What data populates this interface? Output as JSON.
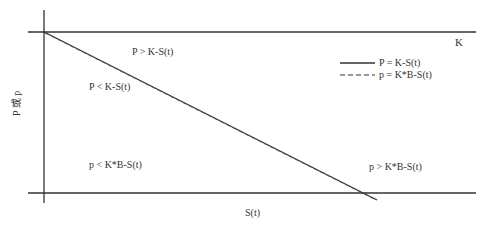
{
  "diagram": {
    "type": "option price bound diagram",
    "axes": {
      "y_label": "P 或 p",
      "x_label": "S(t)"
    },
    "horizontal_line_label": "K",
    "regions": [
      {
        "id": "upper-right",
        "text": "P > K-S(t)"
      },
      {
        "id": "upper-left",
        "text": "P < K-S(t)"
      },
      {
        "id": "lower-left",
        "text": "p < K*B-S(t)"
      },
      {
        "id": "lower-right",
        "text": "p > K*B-S(t)"
      }
    ],
    "legend": [
      {
        "style": "solid",
        "label": "P = K-S(t)"
      },
      {
        "style": "dashed",
        "label": "p = K*B-S(t)"
      }
    ],
    "colors": {
      "line": "#333333",
      "text": "#333333",
      "background": "#ffffff"
    }
  }
}
